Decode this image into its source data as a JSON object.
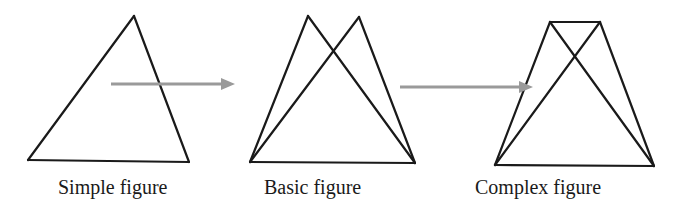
{
  "figures": [
    {
      "id": "simple",
      "label": "Simple figure",
      "label_pos": {
        "x": 58,
        "y": 177
      },
      "lines": [
        [
          [
            134,
            16
          ],
          [
            28,
            160
          ]
        ],
        [
          [
            134,
            16
          ],
          [
            189,
            162
          ]
        ],
        [
          [
            28,
            160
          ],
          [
            189,
            162
          ]
        ]
      ]
    },
    {
      "id": "basic",
      "label": "Basic figure",
      "label_pos": {
        "x": 264,
        "y": 177
      },
      "lines": [
        [
          [
            308,
            16
          ],
          [
            250,
            162
          ]
        ],
        [
          [
            308,
            16
          ],
          [
            415,
            163
          ]
        ],
        [
          [
            359,
            17
          ],
          [
            250,
            162
          ]
        ],
        [
          [
            359,
            17
          ],
          [
            415,
            163
          ]
        ],
        [
          [
            250,
            162
          ],
          [
            415,
            163
          ]
        ]
      ]
    },
    {
      "id": "complex",
      "label": "Complex figure",
      "label_pos": {
        "x": 475,
        "y": 177
      },
      "lines": [
        [
          [
            550,
            22
          ],
          [
            600,
            22
          ]
        ],
        [
          [
            550,
            22
          ],
          [
            495,
            165
          ]
        ],
        [
          [
            550,
            22
          ],
          [
            654,
            166
          ]
        ],
        [
          [
            600,
            22
          ],
          [
            495,
            165
          ]
        ],
        [
          [
            600,
            22
          ],
          [
            654,
            166
          ]
        ],
        [
          [
            495,
            165
          ],
          [
            654,
            166
          ]
        ]
      ]
    }
  ],
  "arrows": [
    {
      "id": "simple-to-basic",
      "from": [
        111,
        84
      ],
      "to": [
        235,
        84
      ]
    },
    {
      "id": "basic-to-complex",
      "from": [
        400,
        87
      ],
      "to": [
        533,
        87
      ]
    }
  ],
  "colors": {
    "line": "#1a1a1a",
    "arrow": "#9a9a9a",
    "background": "#ffffff"
  }
}
